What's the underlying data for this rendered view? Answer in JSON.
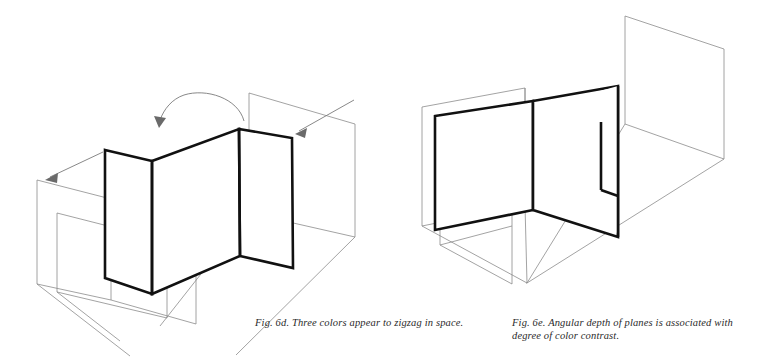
{
  "page": {
    "background_color": "#ffffff",
    "width": 759,
    "height": 362,
    "ink_color": "#111111",
    "faint_line_color": "#8b8b8b",
    "arrow_color": "#7a7a7a"
  },
  "figures": [
    {
      "id": "fig-6d",
      "label": "Fig. 6d.",
      "caption": "Fig. 6d. Three colors appear to zigzag in space.",
      "description": "Isometric line drawing of three folded planes zigzagging in a box-like space, with a curved rotation arrow above and two straight pointer arrows.",
      "annotations": [
        {
          "name": "rotation-arrow",
          "kind": "curved-arrow",
          "direction": "right-to-left"
        },
        {
          "name": "left-pointer-arrow",
          "kind": "straight-arrow",
          "direction": "down-left"
        },
        {
          "name": "right-pointer-arrow",
          "kind": "straight-arrow",
          "direction": "down-left"
        }
      ]
    },
    {
      "id": "fig-6e",
      "label": "Fig. 6e.",
      "caption": "Fig. 6e. Angular depth of planes is associated with\ndegree of color contrast.",
      "description": "Isometric line drawing of angled planes receding in depth, with a faint background plane at the right.",
      "annotations": []
    }
  ],
  "captions": {
    "fig_6d": "Fig. 6d. Three colors appear to zigzag in space.",
    "fig_6e": "Fig. 6e. Angular depth of planes is associated with\ndegree of color contrast."
  },
  "geometry": {
    "fig_6d": {
      "bold_zigzag_top": [
        [
          105,
          150
        ],
        [
          152,
          161
        ],
        [
          239,
          129
        ],
        [
          292,
          138
        ]
      ],
      "bold_zigzag_bottom": [
        [
          105,
          278
        ],
        [
          152,
          294
        ],
        [
          240,
          256
        ],
        [
          293,
          268
        ]
      ],
      "faint_front_plane": [
        [
          37,
          180
        ],
        [
          111,
          199
        ],
        [
          111,
          300
        ],
        [
          37,
          284
        ]
      ],
      "faint_inner_rect": [
        [
          55,
          212
        ],
        [
          148,
          236
        ],
        [
          148,
          315
        ],
        [
          55,
          292
        ]
      ],
      "faint_back_plane": [
        [
          249,
          93
        ],
        [
          355,
          124
        ],
        [
          355,
          237
        ],
        [
          249,
          213
        ]
      ],
      "floor_lines": [
        [
          37,
          284
        ],
        [
          160,
          326
        ],
        [
          355,
          237
        ]
      ]
    },
    "fig_6e": {
      "bold_left_plane": [
        [
          435,
          116
        ],
        [
          533,
          101
        ],
        [
          533,
          210
        ],
        [
          435,
          230
        ]
      ],
      "bold_center_plane": [
        [
          533,
          101
        ],
        [
          618,
          86
        ],
        [
          618,
          237
        ],
        [
          533,
          210
        ]
      ],
      "bold_right_flap": [
        [
          618,
          86
        ],
        [
          618,
          237
        ]
      ],
      "faint_left_plane": [
        [
          422,
          107
        ],
        [
          524,
          88
        ],
        [
          524,
          205
        ],
        [
          422,
          226
        ]
      ],
      "faint_inner_rect": [
        [
          440,
          134
        ],
        [
          511,
          122
        ],
        [
          511,
          223
        ],
        [
          440,
          243
        ]
      ],
      "faint_back_plane": [
        [
          625,
          16
        ],
        [
          724,
          49
        ],
        [
          724,
          159
        ],
        [
          625,
          124
        ]
      ],
      "floor_lines": [
        [
          422,
          226
        ],
        [
          527,
          283
        ],
        [
          724,
          159
        ]
      ]
    }
  }
}
